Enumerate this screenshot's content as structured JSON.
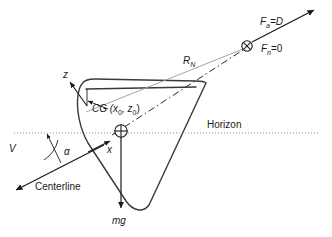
{
  "figure": {
    "background_color": "#ffffff",
    "width": 332,
    "height": 237
  },
  "labels": {
    "aero_force": "F",
    "aero_force_sub": "a",
    "aero_force_eq": "=D",
    "normal_force": "F",
    "normal_force_sub": "n",
    "normal_force_eq": "=0",
    "resultant_radius": "R",
    "resultant_radius_sub": "N",
    "center_of_gravity": "CG (x",
    "center_of_gravity_sub1": "0",
    "center_of_gravity_mid": ", z",
    "center_of_gravity_sub2": "0",
    "center_of_gravity_end": ")",
    "horizon": "Horizon",
    "velocity": "V",
    "alpha": "α",
    "axis_x": "x",
    "axis_z": "z",
    "centerline": "Centerline",
    "weight": "mg"
  },
  "colors": {
    "outline": "#3a3a3a",
    "text": "#1a1a1a",
    "horizon": "#8a8a8a",
    "radius_line": "#9a9a9a",
    "dashdot": "#2a2a2a",
    "background": "#ffffff"
  },
  "icons": {
    "cg_marker": "circled-plus",
    "pressure_center_marker": "circled-times",
    "arrowhead": "solid-triangle"
  },
  "geometry": {
    "cg_point": [
      121,
      131
    ],
    "pressure_center_point": [
      247,
      46
    ],
    "horizon_y": 133,
    "angle_of_attack_deg": 22
  }
}
